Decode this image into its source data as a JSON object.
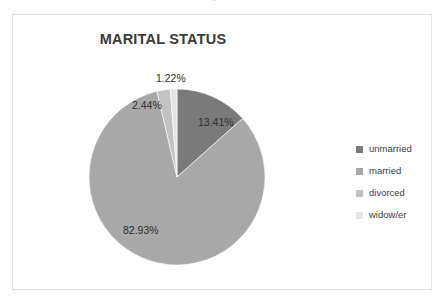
{
  "artifact": {
    "top_text": "and the text was cut off above the chart area boundary"
  },
  "chart": {
    "title": "MARITAL STATUS"
  },
  "legend": {
    "items": [
      {
        "label": "unmarried",
        "color": "#7a7a7a"
      },
      {
        "label": "married",
        "color": "#a8a8a8"
      },
      {
        "label": "divorced",
        "color": "#c2c2c2"
      },
      {
        "label": "widow/er",
        "color": "#e4e4e4"
      }
    ]
  },
  "labels": {
    "unmarried": "13.41%",
    "married": "82.93%",
    "divorced": "2.44%",
    "widower": "1.22%"
  },
  "chart_data": {
    "type": "pie",
    "title": "MARITAL STATUS",
    "categories": [
      "unmarried",
      "married",
      "divorced",
      "widow/er"
    ],
    "values": [
      13.41,
      82.93,
      2.44,
      1.22
    ],
    "value_labels": [
      "13.41%",
      "82.93%",
      "2.44%",
      "1.22%"
    ],
    "colors": [
      "#7a7a7a",
      "#a8a8a8",
      "#c2c2c2",
      "#e4e4e4"
    ],
    "units": "percent",
    "total": 100.0,
    "start_angle_deg": 0,
    "direction": "clockwise",
    "legend_position": "right",
    "grid": false,
    "xlabel": "",
    "ylabel": ""
  }
}
